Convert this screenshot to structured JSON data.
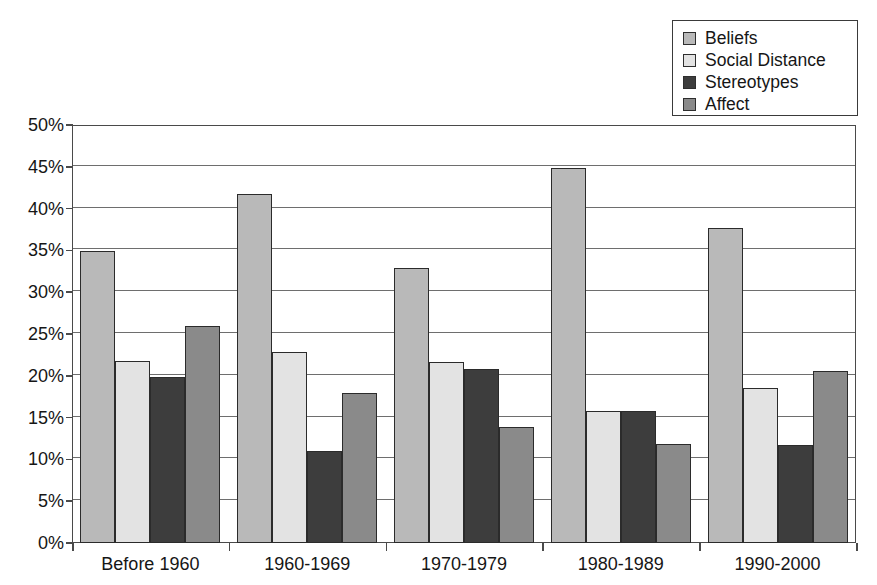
{
  "chart_data": {
    "type": "bar",
    "title": "",
    "subtitle": "",
    "xlabel": "",
    "ylabel": "",
    "categories": [
      "Before 1960",
      "1960-1969",
      "1970-1979",
      "1980-1989",
      "1990-2000"
    ],
    "series": [
      {
        "name": "Beliefs",
        "color": "#b9b9b9",
        "values": [
          34.9,
          41.8,
          32.9,
          44.8,
          37.7
        ]
      },
      {
        "name": "Social Distance",
        "color": "#e3e3e3",
        "values": [
          21.8,
          22.9,
          21.7,
          15.8,
          18.6
        ]
      },
      {
        "name": "Stereotypes",
        "color": "#3d3d3d",
        "values": [
          19.8,
          11.0,
          20.8,
          15.8,
          11.7
        ]
      },
      {
        "name": "Affect",
        "color": "#8a8a8a",
        "values": [
          25.9,
          17.9,
          13.9,
          11.8,
          20.6
        ]
      }
    ],
    "ylim": [
      0,
      50
    ],
    "ytick_step": 5,
    "ytick_labels": [
      "0%",
      "5%",
      "10%",
      "15%",
      "20%",
      "25%",
      "30%",
      "35%",
      "40%",
      "45%",
      "50%"
    ],
    "grid": true,
    "grid_axis": "y",
    "legend_position": "top-right",
    "value_suffix": "%"
  },
  "legend": {
    "entries": [
      {
        "label": "Beliefs"
      },
      {
        "label": "Social Distance"
      },
      {
        "label": "Stereotypes"
      },
      {
        "label": "Affect"
      }
    ]
  }
}
